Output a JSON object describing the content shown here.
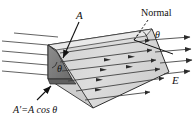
{
  "figure": {
    "type": "physics-diagram",
    "background_color": "#ffffff",
    "line_color": "#111111",
    "surface_fill": "#d6d6d6",
    "surface_fill_light": "#e2e2e2",
    "projection_fill": "#8a8a8a",
    "projection_fill_dark": "#6f6f6f"
  },
  "labels": {
    "area": "A",
    "normal": "Normal",
    "angle_top": "θ",
    "angle_inner": "θ",
    "field": "E",
    "projected_area": "A′=A cos θ"
  },
  "annotations": {
    "area_leader": "arrow from A label down-right to tilted surface",
    "normal_leader": "dashed line from Normal label down-left to surface corner",
    "projected_area_leader": "arrow from A'=A cos θ label up-right to dark triangle"
  },
  "field_lines": {
    "count": 12,
    "direction": "left-to-right, slightly downward",
    "arrowhead": "filled triangle"
  }
}
